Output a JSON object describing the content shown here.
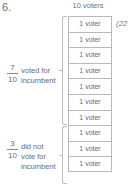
{
  "problem": {
    "number": "6."
  },
  "diagram": {
    "column_header": "10 voters",
    "box_label": "1 voter",
    "total_boxes": 10,
    "side_annotation": "(22",
    "groups": [
      {
        "name": "voted-for-incumbent",
        "count": 7,
        "fraction": {
          "numerator": "7",
          "denominator": "10"
        },
        "text": "voted for\nincumbent"
      },
      {
        "name": "did-not-vote-for-incumbent",
        "count": 3,
        "fraction": {
          "numerator": "3",
          "denominator": "10"
        },
        "text": "did not\nvote for\nincumbent"
      }
    ]
  },
  "colors": {
    "text": "#6b6b6b",
    "box_border": "#b9b9b9",
    "brace": "#bdbdbd",
    "background": "#ffffff"
  }
}
